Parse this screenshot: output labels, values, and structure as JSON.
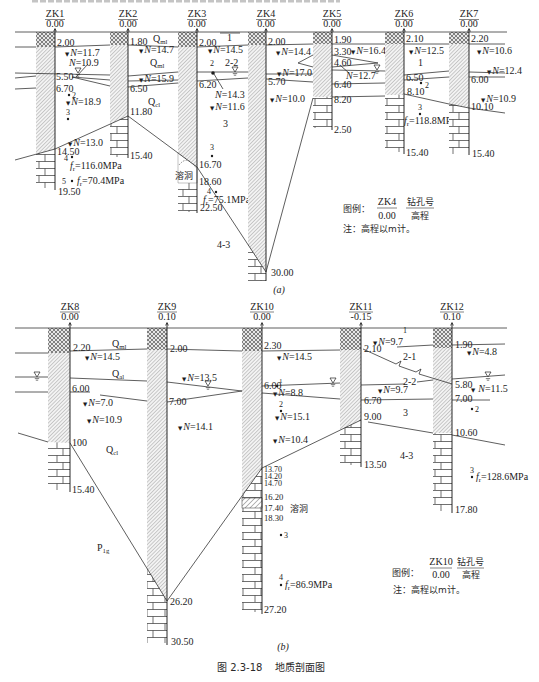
{
  "figure": {
    "number": "图 2.3-18",
    "title": "地质剖面图"
  },
  "symbols": {
    "spt_marker": "▼",
    "spt_symbol": "N",
    "equals": "=",
    "strength_symbol": "f",
    "strength_sub": "r"
  },
  "section_a": {
    "caption": "(a)",
    "boreholes": [
      {
        "id": "ZK1",
        "elevation": "0.00",
        "depths": [
          "2.00",
          "5.50",
          "6.70",
          "14.50",
          "19.50"
        ],
        "spt": [
          "11.7",
          "10.9",
          "18.9",
          "13.0"
        ],
        "samples": [
          {
            "no": "2"
          },
          {
            "no": "3"
          },
          {
            "no": "4",
            "strength": "116.0MPa"
          },
          {
            "no": "5",
            "strength": "70.4MPa"
          }
        ]
      },
      {
        "id": "ZK2",
        "elevation": "0.00",
        "depths": [
          "1.80",
          "6.50",
          "11.80",
          "15.40"
        ],
        "spt": [
          "14.7",
          "15.9"
        ]
      },
      {
        "id": "ZK3",
        "elevation": "0.00",
        "depths": [
          "2.00",
          "6.20",
          "16.70",
          "18.60",
          "22.50"
        ],
        "spt": [
          "14.5",
          "14.3",
          "11.6"
        ],
        "samples": [
          {
            "no": "2"
          },
          {
            "no": "3"
          },
          {
            "no": "4",
            "strength": "75.1MPa"
          }
        ],
        "cave": "溶洞"
      },
      {
        "id": "ZK4",
        "elevation": "0.00",
        "depths": [
          "2.00",
          "5.70",
          "30.00"
        ],
        "spt": [
          "14.4",
          "17.0",
          "10.0"
        ]
      },
      {
        "id": "ZK5",
        "elevation": "0.00",
        "depths": [
          "1.90",
          "3.30",
          "4.60",
          "6.40",
          "8.20",
          "2.50"
        ],
        "spt": [
          "16.4",
          "12.7"
        ]
      },
      {
        "id": "ZK6",
        "elevation": "0.00",
        "depths": [
          "2.10",
          "6.50",
          "8.10",
          "15.40"
        ],
        "spt": [
          "12.5"
        ],
        "samples": [
          {
            "no": "2"
          },
          {
            "no": "3",
            "strength": "118.8MPa"
          }
        ]
      },
      {
        "id": "ZK7",
        "elevation": "0.00",
        "depths": [
          "2.20",
          "6.00",
          "10.10",
          "15.40"
        ],
        "spt": [
          "10.6",
          "12.4",
          "10.9"
        ]
      }
    ],
    "strata": {
      "fill_ml_upper": {
        "symbol": "Q",
        "sub": "ml"
      },
      "fill_ml_lower": {
        "symbol": "Q",
        "sub": "ml"
      },
      "residual_cl": {
        "symbol": "Q",
        "sub": "cl"
      },
      "layer_1_zk3": "1",
      "layer_2_2": "2-2",
      "layer_3": "3",
      "layer_4_3": "4-3",
      "layer_1_zk6": "1"
    },
    "legend": {
      "prefix": "图例：",
      "id": "ZK4",
      "elevation": "0.00",
      "id_desc": "钻孔号",
      "elevation_desc": "高程",
      "note": "注：高程以m计。"
    }
  },
  "section_b": {
    "caption": "(b)",
    "boreholes": [
      {
        "id": "ZK8",
        "elevation": "0.00",
        "depths": [
          "2.20",
          "6.00",
          "100",
          "15.40"
        ],
        "spt": [
          "14.5",
          "7.0",
          "10.9"
        ]
      },
      {
        "id": "ZK9",
        "elevation": "0.10",
        "depths": [
          "2.00",
          "7.00",
          "26.20",
          "30.50"
        ],
        "spt": [
          "13.5",
          "14.1"
        ]
      },
      {
        "id": "ZK10",
        "elevation": "0.00",
        "depths": [
          "2.30",
          "6.00",
          "13.70",
          "14.20",
          "14.70",
          "16.20",
          "17.40",
          "18.30",
          "27.20"
        ],
        "spt": [
          "14.5",
          "8.8",
          "15.1",
          "10.4"
        ],
        "samples": [
          {
            "no": "1"
          },
          {
            "no": "2"
          },
          {
            "no": "3"
          },
          {
            "no": "4",
            "strength": "86.9MPa"
          }
        ],
        "cave": "溶洞"
      },
      {
        "id": "ZK11",
        "elevation": "-0.15",
        "depths": [
          "2.10",
          "6.70",
          "9.00",
          "13.50"
        ],
        "spt": [
          "9.7",
          "9.7"
        ]
      },
      {
        "id": "ZK12",
        "elevation": "0.10",
        "depths": [
          "1.90",
          "5.80",
          "7.00",
          "10.60",
          "17.80"
        ],
        "spt": [
          "4.8",
          "11.5"
        ],
        "samples": [
          {
            "no": "2"
          },
          {
            "no": "3",
            "strength": "128.6MPa"
          }
        ]
      }
    ],
    "strata": {
      "fill_ml": {
        "symbol": "Q",
        "sub": "ml"
      },
      "alluvial_al": {
        "symbol": "Q",
        "sub": "al"
      },
      "residual_cl": {
        "symbol": "Q",
        "sub": "cl"
      },
      "bedrock_p1g": {
        "symbol": "P",
        "sub": "1",
        "suffix": "g"
      },
      "layer_1": "1",
      "layer_2_1": "2-1",
      "layer_2_2": "2-2",
      "layer_3": "3",
      "layer_4_3": "4-3"
    },
    "legend": {
      "prefix": "图例：",
      "id": "ZK10",
      "elevation": "0.00",
      "id_desc": "钻孔号",
      "elevation_desc": "高程",
      "note": "注：高程以m计。"
    }
  }
}
